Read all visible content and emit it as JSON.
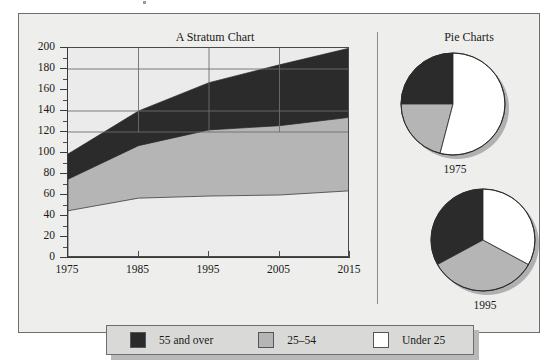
{
  "figure": {
    "stratum_title": "A Stratum Chart",
    "pies_title": "Pie Charts"
  },
  "colors": {
    "series_55_and_over": "#2b2b2b",
    "series_25_54": "#b5b5b5",
    "series_under_25": "#ececec",
    "panel_background": "#eeeeec",
    "plot_background": "#ebebeb",
    "frame": "#6e6e6e",
    "axis": "#3a3a3a",
    "gridline": "#6d6d6d",
    "shadow": "#b9b9b9",
    "legend_background": "#d9d9d7",
    "text": "#1a1a1a"
  },
  "legend": {
    "entries": [
      {
        "label": "55 and over",
        "color": "#2b2b2b",
        "icon": "legend-swatch-dark"
      },
      {
        "label": "25–54",
        "color": "#b5b5b5",
        "icon": "legend-swatch-gray"
      },
      {
        "label": "Under 25",
        "color": "#ffffff",
        "icon": "legend-swatch-white"
      }
    ]
  },
  "chart_data": [
    {
      "type": "area",
      "id": "stratum-chart",
      "title": "A Stratum Chart",
      "xlabel": "",
      "ylabel": "",
      "x": [
        1975,
        1985,
        1995,
        2005,
        2015
      ],
      "xtick_labels": [
        "1975",
        "1985",
        "1995",
        "2005",
        "2015"
      ],
      "xlim": [
        1975,
        2015
      ],
      "ylim": [
        0,
        200
      ],
      "ytick_labels": [
        "0",
        "20",
        "40",
        "60",
        "80",
        "100",
        "120",
        "140",
        "160",
        "180",
        "200"
      ],
      "ytick_values": [
        0,
        20,
        40,
        60,
        80,
        100,
        120,
        140,
        160,
        180,
        200
      ],
      "minor_ticks": true,
      "grid": "gridlines at y = 120, 140, 180 and x = 1985, 1995, 2005, 2015",
      "stacked": true,
      "stack_order_bottom_to_top": [
        "Under 25",
        "25–54",
        "55 and over"
      ],
      "series": [
        {
          "name": "Under 25",
          "color": "#ececec",
          "values": [
            45,
            57,
            59,
            60,
            64
          ],
          "cumulative_top": [
            45,
            57,
            59,
            60,
            64
          ]
        },
        {
          "name": "25–54",
          "color": "#b5b5b5",
          "values": [
            30,
            50,
            63,
            66,
            70
          ],
          "cumulative_top": [
            75,
            107,
            122,
            126,
            134
          ]
        },
        {
          "name": "55 and over",
          "color": "#2b2b2b",
          "values": [
            24,
            33,
            45,
            58,
            66
          ],
          "cumulative_top": [
            99,
            140,
            167,
            184,
            200
          ]
        }
      ]
    },
    {
      "type": "pie",
      "id": "pie-1975",
      "title": "Pie Charts",
      "caption": "1975",
      "labels": [
        "55 and over",
        "25–54",
        "Under 25"
      ],
      "values": [
        25,
        21,
        54
      ],
      "colors": [
        "#2b2b2b",
        "#b5b5b5",
        "#ffffff"
      ]
    },
    {
      "type": "pie",
      "id": "pie-1995",
      "caption": "1995",
      "labels": [
        "55 and over",
        "25–54",
        "Under 25"
      ],
      "values": [
        33,
        34,
        33
      ],
      "colors": [
        "#2b2b2b",
        "#b5b5b5",
        "#ffffff"
      ]
    }
  ]
}
